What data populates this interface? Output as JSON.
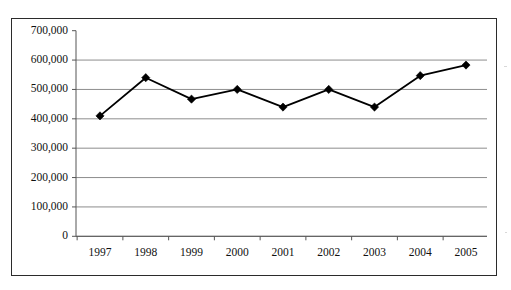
{
  "figure": {
    "clipped_caption": "",
    "background_color": "#ffffff",
    "border_color": "#2b2b2b"
  },
  "style": {
    "line_color": "#000000",
    "marker_color": "#000000",
    "gridline_color": "#808080",
    "axis_color": "#555555",
    "tick_label_color": "#111111"
  },
  "chart_data": {
    "type": "line",
    "title": "",
    "xlabel": "",
    "ylabel": "",
    "categories": [
      "1997",
      "1998",
      "1999",
      "2000",
      "2001",
      "2002",
      "2003",
      "2004",
      "2005"
    ],
    "values": [
      410000,
      540000,
      467000,
      500000,
      440000,
      500000,
      440000,
      547000,
      583000
    ],
    "series": [
      {
        "name": "",
        "values": [
          410000,
          540000,
          467000,
          500000,
          440000,
          500000,
          440000,
          547000,
          583000
        ]
      }
    ],
    "ylim": [
      0,
      700000
    ],
    "ytick_values": [
      0,
      100000,
      200000,
      300000,
      400000,
      500000,
      600000,
      700000
    ],
    "ytick_labels": [
      "0",
      "100,000",
      "200,000",
      "300,000",
      "400,000",
      "500,000",
      "600,000",
      "700,000"
    ],
    "xtick_labels": [
      "1997",
      "1998",
      "1999",
      "2000",
      "2001",
      "2002",
      "2003",
      "2004",
      "2005"
    ],
    "grid": true,
    "grid_axis": "y",
    "legend": false,
    "legend_position": "none",
    "marker": "diamond"
  }
}
